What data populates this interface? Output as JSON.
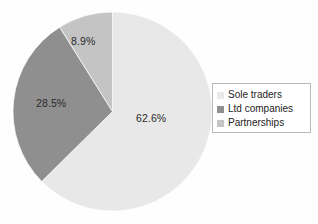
{
  "chart_data": {
    "type": "pie",
    "title": "",
    "subtitle": "",
    "xlabel": "",
    "ylabel": "",
    "legend_position": "right",
    "grid": false,
    "start_angle_deg": 0,
    "direction": "clockwise",
    "categories": [
      "Sole traders",
      "Ltd companies",
      "Partnerships"
    ],
    "values": [
      62.6,
      28.5,
      8.9
    ],
    "value_unit": "%",
    "data_labels": [
      "62.6%",
      "28.5%",
      "8.9%"
    ],
    "colors": [
      "#e8e8e8",
      "#8f8f8f",
      "#c4c4c4"
    ],
    "slices": [
      {
        "label": "Sole traders",
        "value": 62.6,
        "data_label": "62.6%",
        "color": "#e8e8e8"
      },
      {
        "label": "Ltd companies",
        "value": 28.5,
        "data_label": "28.5%",
        "color": "#8f8f8f"
      },
      {
        "label": "Partnerships",
        "value": 8.9,
        "data_label": "8.9%",
        "color": "#c4c4c4"
      }
    ]
  },
  "legend": {
    "items": [
      {
        "label": "Sole traders",
        "color": "#e8e8e8"
      },
      {
        "label": "Ltd companies",
        "color": "#8f8f8f"
      },
      {
        "label": "Partnerships",
        "color": "#c4c4c4"
      }
    ]
  },
  "style": {
    "background": "#fefefe",
    "label_color": "#2b2b2b",
    "legend_border": "#b9b9b9",
    "slice_outline": "#ffffff"
  }
}
